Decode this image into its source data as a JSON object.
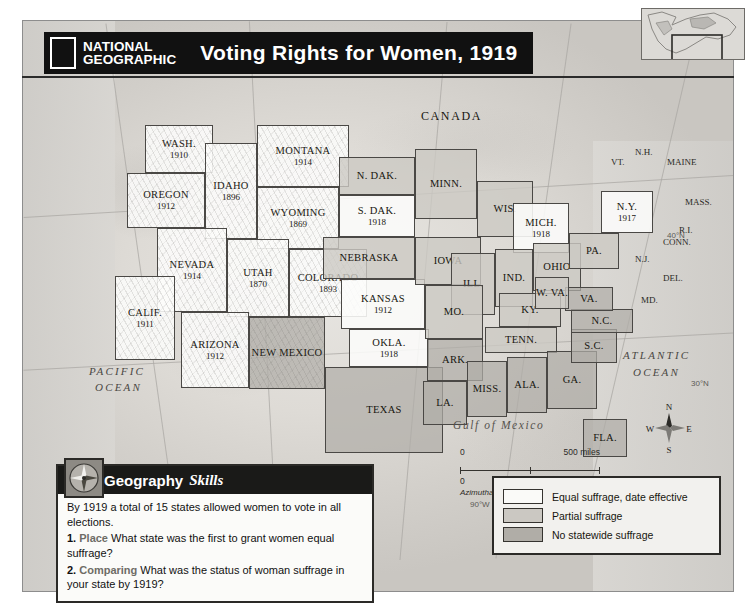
{
  "title": {
    "logo_line1": "NATIONAL",
    "logo_line2": "GEOGRAPHIC",
    "map_title": "Voting Rights for Women, 1919"
  },
  "countries": [
    {
      "name": "CANADA",
      "x": 398,
      "y": 88
    },
    {
      "name": "MEXICO",
      "x": 255,
      "y": 440
    }
  ],
  "oceans": [
    {
      "name": "PACIFIC",
      "x": 66,
      "y": 344
    },
    {
      "name": "OCEAN",
      "x": 72,
      "y": 360
    },
    {
      "name": "ATLANTIC",
      "x": 600,
      "y": 328
    },
    {
      "name": "OCEAN",
      "x": 610,
      "y": 345
    }
  ],
  "gulf_label": "Gulf of Mexico",
  "graticule_labels": [
    {
      "text": "40°N",
      "x": 644,
      "y": 210
    },
    {
      "text": "30°N",
      "x": 668,
      "y": 358
    },
    {
      "text": "90°W",
      "x": 447,
      "y": 479
    },
    {
      "text": "80°W",
      "x": 556,
      "y": 474
    }
  ],
  "states": [
    {
      "id": "wash",
      "name": "WASH.",
      "year": "1910",
      "status": "equal",
      "x": 122,
      "y": 104,
      "w": 68,
      "h": 48,
      "relief": true
    },
    {
      "id": "oreg",
      "name": "OREGON",
      "year": "1912",
      "status": "equal",
      "x": 104,
      "y": 152,
      "w": 78,
      "h": 55,
      "relief": true
    },
    {
      "id": "idaho",
      "name": "IDAHO",
      "year": "1896",
      "status": "equal",
      "x": 182,
      "y": 122,
      "w": 52,
      "h": 96,
      "relief": true
    },
    {
      "id": "mont",
      "name": "MONTANA",
      "year": "1914",
      "status": "equal",
      "x": 234,
      "y": 104,
      "w": 92,
      "h": 62,
      "relief": true
    },
    {
      "id": "wyom",
      "name": "WYOMING",
      "year": "1869",
      "status": "equal",
      "x": 234,
      "y": 166,
      "w": 82,
      "h": 62,
      "relief": true
    },
    {
      "id": "nev",
      "name": "NEVADA",
      "year": "1914",
      "status": "equal",
      "x": 134,
      "y": 207,
      "w": 70,
      "h": 84,
      "relief": true
    },
    {
      "id": "utah",
      "name": "UTAH",
      "year": "1870",
      "status": "equal",
      "x": 204,
      "y": 218,
      "w": 62,
      "h": 78,
      "relief": true
    },
    {
      "id": "colo",
      "name": "COLORADO",
      "year": "1893",
      "status": "equal",
      "x": 266,
      "y": 228,
      "w": 78,
      "h": 68,
      "relief": true
    },
    {
      "id": "calif",
      "name": "CALIF.",
      "year": "1911",
      "status": "equal",
      "x": 92,
      "y": 255,
      "w": 60,
      "h": 84,
      "relief": true
    },
    {
      "id": "ariz",
      "name": "ARIZONA",
      "year": "1912",
      "status": "equal",
      "x": 158,
      "y": 291,
      "w": 68,
      "h": 76,
      "relief": true
    },
    {
      "id": "nmex",
      "name": "NEW MEXICO",
      "year": "",
      "status": "none",
      "x": 226,
      "y": 296,
      "w": 76,
      "h": 72,
      "relief": true
    },
    {
      "id": "ndak",
      "name": "N. DAK.",
      "year": "",
      "status": "partial",
      "x": 316,
      "y": 136,
      "w": 76,
      "h": 38
    },
    {
      "id": "sdak",
      "name": "S. DAK.",
      "year": "1918",
      "status": "equal",
      "x": 316,
      "y": 174,
      "w": 76,
      "h": 42
    },
    {
      "id": "nebr",
      "name": "NEBRASKA",
      "year": "",
      "status": "partial",
      "x": 300,
      "y": 216,
      "w": 92,
      "h": 42
    },
    {
      "id": "kans",
      "name": "KANSAS",
      "year": "1912",
      "status": "equal",
      "x": 318,
      "y": 258,
      "w": 84,
      "h": 50
    },
    {
      "id": "okla",
      "name": "OKLA.",
      "year": "1918",
      "status": "equal",
      "x": 326,
      "y": 308,
      "w": 80,
      "h": 38
    },
    {
      "id": "texas",
      "name": "TEXAS",
      "year": "",
      "status": "none",
      "x": 302,
      "y": 346,
      "w": 118,
      "h": 86
    },
    {
      "id": "minn",
      "name": "MINN.",
      "year": "",
      "status": "partial",
      "x": 392,
      "y": 128,
      "w": 62,
      "h": 70
    },
    {
      "id": "iowa",
      "name": "IOWA",
      "year": "",
      "status": "partial",
      "x": 392,
      "y": 216,
      "w": 66,
      "h": 48
    },
    {
      "id": "wis",
      "name": "WIS.",
      "year": "",
      "status": "partial",
      "x": 454,
      "y": 160,
      "w": 56,
      "h": 56
    },
    {
      "id": "mich",
      "name": "MICH.",
      "year": "1918",
      "status": "equal",
      "x": 490,
      "y": 182,
      "w": 56,
      "h": 50
    },
    {
      "id": "ill",
      "name": "ILL.",
      "year": "",
      "status": "partial",
      "x": 428,
      "y": 232,
      "w": 44,
      "h": 62
    },
    {
      "id": "ind",
      "name": "IND.",
      "year": "",
      "status": "partial",
      "x": 472,
      "y": 228,
      "w": 38,
      "h": 58
    },
    {
      "id": "ohio",
      "name": "OHIO",
      "year": "",
      "status": "partial",
      "x": 510,
      "y": 222,
      "w": 48,
      "h": 48
    },
    {
      "id": "mo",
      "name": "MO.",
      "year": "",
      "status": "partial",
      "x": 402,
      "y": 264,
      "w": 58,
      "h": 54
    },
    {
      "id": "ky",
      "name": "KY.",
      "year": "",
      "status": "partial",
      "x": 476,
      "y": 272,
      "w": 62,
      "h": 34
    },
    {
      "id": "tenn",
      "name": "TENN.",
      "year": "",
      "status": "partial",
      "x": 462,
      "y": 306,
      "w": 72,
      "h": 26
    },
    {
      "id": "ark",
      "name": "ARK.",
      "year": "",
      "status": "none",
      "x": 404,
      "y": 318,
      "w": 56,
      "h": 42
    },
    {
      "id": "miss",
      "name": "MISS.",
      "year": "",
      "status": "none",
      "x": 444,
      "y": 340,
      "w": 40,
      "h": 56
    },
    {
      "id": "ala",
      "name": "ALA.",
      "year": "",
      "status": "none",
      "x": 484,
      "y": 336,
      "w": 40,
      "h": 56
    },
    {
      "id": "ga",
      "name": "GA.",
      "year": "",
      "status": "none",
      "x": 524,
      "y": 330,
      "w": 50,
      "h": 58
    },
    {
      "id": "la",
      "name": "LA.",
      "year": "",
      "status": "none",
      "x": 400,
      "y": 360,
      "w": 44,
      "h": 44
    },
    {
      "id": "sc",
      "name": "S.C.",
      "year": "",
      "status": "none",
      "x": 548,
      "y": 308,
      "w": 46,
      "h": 34
    },
    {
      "id": "nc",
      "name": "N.C.",
      "year": "",
      "status": "none",
      "x": 548,
      "y": 288,
      "w": 62,
      "h": 24
    },
    {
      "id": "fla",
      "name": "FLA.",
      "year": "",
      "status": "none",
      "x": 560,
      "y": 398,
      "w": 44,
      "h": 38
    },
    {
      "id": "va",
      "name": "VA.",
      "year": "",
      "status": "none",
      "x": 542,
      "y": 266,
      "w": 48,
      "h": 24
    },
    {
      "id": "wva",
      "name": "W. VA.",
      "year": "",
      "status": "partial",
      "x": 512,
      "y": 256,
      "w": 34,
      "h": 32
    },
    {
      "id": "pa",
      "name": "PA.",
      "year": "",
      "status": "partial",
      "x": 546,
      "y": 212,
      "w": 50,
      "h": 36
    },
    {
      "id": "ny",
      "name": "N.Y.",
      "year": "1917",
      "status": "equal",
      "x": 578,
      "y": 170,
      "w": 52,
      "h": 42
    }
  ],
  "small_states": [
    {
      "name": "N.H.",
      "x": 612,
      "y": 126
    },
    {
      "name": "VT.",
      "x": 588,
      "y": 136
    },
    {
      "name": "MAINE",
      "x": 644,
      "y": 136
    },
    {
      "name": "MASS.",
      "x": 662,
      "y": 176
    },
    {
      "name": "R.I.",
      "x": 656,
      "y": 204
    },
    {
      "name": "CONN.",
      "x": 640,
      "y": 216
    },
    {
      "name": "N.J.",
      "x": 612,
      "y": 233
    },
    {
      "name": "DEL.",
      "x": 640,
      "y": 252
    },
    {
      "name": "MD.",
      "x": 618,
      "y": 274
    }
  ],
  "scale": {
    "miles_zero": "0",
    "miles_label": "500 miles",
    "km_zero": "0",
    "km_label": "500 kilometers",
    "projection": "Azimuthal Equal-Area projection"
  },
  "compass": {
    "n": "N",
    "e": "E",
    "s": "S",
    "w": "W"
  },
  "legend": {
    "items": [
      {
        "label": "Equal suffrage, date effective",
        "swatch": "#fafaf8"
      },
      {
        "label": "Partial suffrage",
        "swatch": "#cbc8c2"
      },
      {
        "label": "No statewide suffrage",
        "swatch": "#b0ada7"
      }
    ]
  },
  "geography_skills": {
    "header_bold": "Geography",
    "header_italic": "Skills",
    "intro": "By 1919 a total of 15 states allowed women to vote in all elections.",
    "questions": [
      {
        "num": "1.",
        "type": "Place",
        "text": "What state was the first to grant women equal suffrage?"
      },
      {
        "num": "2.",
        "type": "Comparing",
        "text": "What was the status of woman suffrage in your state by 1919?"
      }
    ]
  }
}
